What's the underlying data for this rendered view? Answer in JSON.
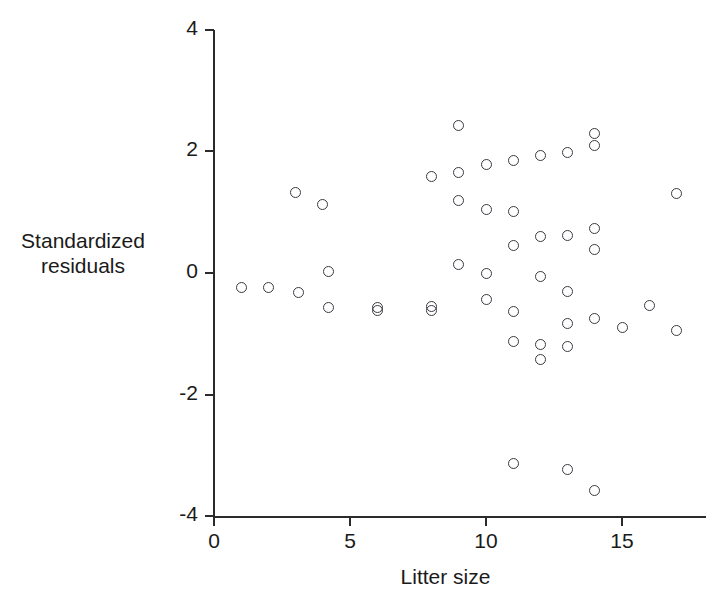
{
  "chart_data": {
    "type": "scatter",
    "title": "",
    "xlabel": "Litter size",
    "ylabel": "Standardized residuals",
    "ylabel_lines": [
      "Standardized",
      "residuals"
    ],
    "xlim": [
      0,
      18.3
    ],
    "ylim": [
      -4,
      4
    ],
    "xticks": [
      0,
      5,
      10,
      15
    ],
    "xticklabels": [
      "0",
      "5",
      "10",
      "15"
    ],
    "yticks": [
      -4,
      -2,
      0,
      2,
      4
    ],
    "yticklabels": [
      "-4",
      "-2",
      "0",
      "2",
      "4"
    ],
    "grid": false,
    "legend": null,
    "marker": "open-circle",
    "marker_color": "#3a3a42",
    "points": [
      {
        "x": 1.0,
        "y": -0.24
      },
      {
        "x": 2.0,
        "y": -0.24
      },
      {
        "x": 3.0,
        "y": 1.32
      },
      {
        "x": 3.1,
        "y": -0.32
      },
      {
        "x": 4.0,
        "y": 1.12
      },
      {
        "x": 4.2,
        "y": 0.03
      },
      {
        "x": 4.2,
        "y": -0.57
      },
      {
        "x": 6.0,
        "y": -0.57
      },
      {
        "x": 6.0,
        "y": -0.62
      },
      {
        "x": 8.0,
        "y": 1.59
      },
      {
        "x": 8.0,
        "y": -0.55
      },
      {
        "x": 8.0,
        "y": -0.62
      },
      {
        "x": 9.0,
        "y": 2.42
      },
      {
        "x": 9.0,
        "y": 1.66
      },
      {
        "x": 9.0,
        "y": 1.2
      },
      {
        "x": 9.0,
        "y": 0.14
      },
      {
        "x": 10.0,
        "y": 1.79
      },
      {
        "x": 10.0,
        "y": 1.05
      },
      {
        "x": 10.0,
        "y": 0.0
      },
      {
        "x": 10.0,
        "y": -0.44
      },
      {
        "x": 11.0,
        "y": 1.85
      },
      {
        "x": 11.0,
        "y": 1.01
      },
      {
        "x": 11.0,
        "y": 0.46
      },
      {
        "x": 11.0,
        "y": -0.64
      },
      {
        "x": 11.0,
        "y": -1.13
      },
      {
        "x": 11.0,
        "y": -3.13
      },
      {
        "x": 12.0,
        "y": 1.94
      },
      {
        "x": 12.0,
        "y": 0.6
      },
      {
        "x": 12.0,
        "y": -0.05
      },
      {
        "x": 12.0,
        "y": -1.18
      },
      {
        "x": 12.0,
        "y": -1.43
      },
      {
        "x": 13.0,
        "y": 1.99
      },
      {
        "x": 13.0,
        "y": 0.61
      },
      {
        "x": 13.0,
        "y": -0.3
      },
      {
        "x": 13.0,
        "y": -0.83
      },
      {
        "x": 13.0,
        "y": -1.21
      },
      {
        "x": 13.0,
        "y": -3.23
      },
      {
        "x": 14.0,
        "y": 2.3
      },
      {
        "x": 14.0,
        "y": 2.1
      },
      {
        "x": 14.0,
        "y": 0.73
      },
      {
        "x": 14.0,
        "y": 0.39
      },
      {
        "x": 14.0,
        "y": -0.75
      },
      {
        "x": 14.0,
        "y": -3.57
      },
      {
        "x": 15.0,
        "y": -0.89
      },
      {
        "x": 16.0,
        "y": -0.54
      },
      {
        "x": 17.0,
        "y": 1.3
      },
      {
        "x": 17.0,
        "y": -0.95
      }
    ]
  }
}
